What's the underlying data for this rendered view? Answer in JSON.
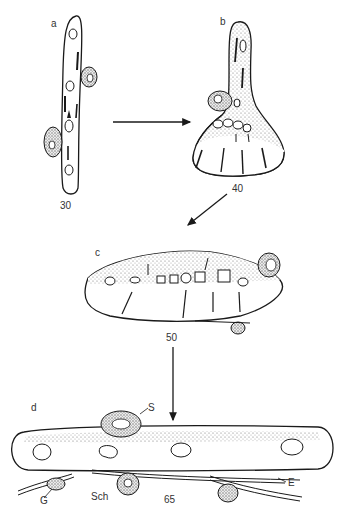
{
  "figure": {
    "panels": [
      {
        "id": "a",
        "label": "a",
        "stage": "30"
      },
      {
        "id": "b",
        "label": "b",
        "stage": "40"
      },
      {
        "id": "c",
        "label": "c",
        "stage": "50"
      },
      {
        "id": "d",
        "label": "d",
        "stage": "65"
      }
    ],
    "annotations": {
      "S": "S",
      "G": "G",
      "Sch": "Sch",
      "E": "E"
    },
    "colors": {
      "ink": "#1a1a1a",
      "stipple": "#9a9a9a",
      "background": "#ffffff"
    }
  }
}
